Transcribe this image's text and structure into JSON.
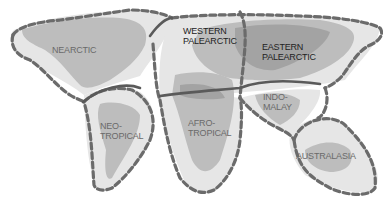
{
  "map": {
    "title": "Zoogeographic realms",
    "colors": {
      "background": "#ffffff",
      "region_fill": "#e6e6e6",
      "land_light": "#cfcfcf",
      "land_dark": "#a9a9a9",
      "boundary": "#6b6b6b"
    },
    "realms": [
      {
        "id": "nearctic",
        "label": "NEARCTIC"
      },
      {
        "id": "western-palearctic",
        "label": "WESTERN\nPALEARCTIC"
      },
      {
        "id": "eastern-palearctic",
        "label": "EASTERN\nPALEARCTIC"
      },
      {
        "id": "neotropical",
        "label": "NEO-\nTROPICAL"
      },
      {
        "id": "afrotropical",
        "label": "AFRO-\nTROPICAL"
      },
      {
        "id": "indo-malay",
        "label": "INDO-\nMALAY"
      },
      {
        "id": "australasia",
        "label": "AUSTRALASIA"
      }
    ]
  }
}
